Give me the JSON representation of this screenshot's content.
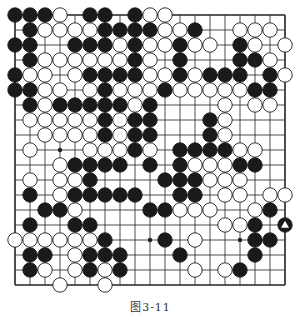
{
  "diagram": {
    "type": "go-board",
    "size": 19,
    "caption": "图3-11",
    "colors": {
      "line": "#222222",
      "black": "#1a1a1a",
      "white": "#ffffff",
      "background": "#ffffff"
    },
    "star_points": [
      [
        3,
        3
      ],
      [
        3,
        9
      ],
      [
        3,
        15
      ],
      [
        9,
        3
      ],
      [
        9,
        9
      ],
      [
        9,
        15
      ],
      [
        15,
        3
      ],
      [
        15,
        9
      ],
      [
        15,
        15
      ]
    ],
    "marked": [
      {
        "row": 14,
        "col": 18,
        "mark": "triangle"
      }
    ],
    "rows": [
      "BBBW.BB.BWW........",
      ".BWWWWBBBBWWB..WWW.",
      "BB..BBBWBWWBWW.BW.W",
      ".BWWWWWWBW.B...BBW.",
      "BWW.WBBBBWWBWBBB.BW",
      "BBWW.WBWWWBWWWWWBB.",
      ".BWBBBBBWB....W.WW.",
      ".WWWWWBWBB...BW....",
      "..WWWWBWBB...BW....",
      ".W...WWWBW.BBBBWW..",
      "...WBBBB.B.BWWWBB..",
      ".W.WWB....BBBWWW...",
      ".B.WBBBBB..BB.WW.WW",
      "..BBW....BBWWW..WB.",
      ".B..BB........WWB.B",
      "WWWWWWB...B.W...BB.",
      ".BB.WBBB...B....B..",
      ".BW.WBWB....W.WB...",
      "...W..W............"
    ]
  }
}
